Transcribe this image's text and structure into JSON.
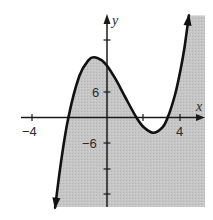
{
  "chart_data": {
    "type": "line",
    "title": "",
    "xlabel": "x",
    "ylabel": "y",
    "shaded_region": "below curve (y <= f(x))",
    "x_ticks": [
      -4,
      2,
      4
    ],
    "x_tick_labels": [
      {
        "value": -4,
        "label": "−4"
      },
      {
        "value": 4,
        "label": "4"
      }
    ],
    "y_ticks": [
      18,
      6,
      -6,
      -12,
      -18
    ],
    "y_tick_labels": [
      {
        "value": 6,
        "label": "6"
      },
      {
        "value": -6,
        "label": "−6"
      }
    ],
    "xlim": [
      -4.7,
      5.2
    ],
    "ylim": [
      -21,
      24
    ],
    "grid": false,
    "roots_approx": [
      -2.1,
      1.6,
      3.3
    ],
    "local_max_approx": {
      "x": -0.7,
      "y": 14.2
    },
    "local_min_approx": {
      "x": 2.5,
      "y": -3.6
    },
    "y_intercept_approx": 12.2,
    "series": [
      {
        "name": "f(x)",
        "points": [
          [
            -2.82,
            -21.2
          ],
          [
            -2.5,
            -10.5
          ],
          [
            -2.1,
            0
          ],
          [
            -1.5,
            9.8
          ],
          [
            -1.0,
            13.5
          ],
          [
            -0.7,
            14.2
          ],
          [
            -0.3,
            13.5
          ],
          [
            0,
            12.2
          ],
          [
            0.5,
            8.8
          ],
          [
            1.0,
            4.7
          ],
          [
            1.6,
            0
          ],
          [
            2.0,
            -2.3
          ],
          [
            2.5,
            -3.6
          ],
          [
            3.0,
            -2.4
          ],
          [
            3.3,
            0
          ],
          [
            3.7,
            5.4
          ],
          [
            4.0,
            11.3
          ],
          [
            4.2,
            16.2
          ],
          [
            4.45,
            24.0
          ]
        ]
      }
    ]
  },
  "labels": {
    "x_axis": "x",
    "y_axis": "y",
    "x_neg4": "−4",
    "x_4": "4",
    "y_6": "6",
    "y_neg6": "−6"
  },
  "colors": {
    "shade": "#c4c4c4",
    "curve": "#111111",
    "axis": "#1a1a1a"
  }
}
